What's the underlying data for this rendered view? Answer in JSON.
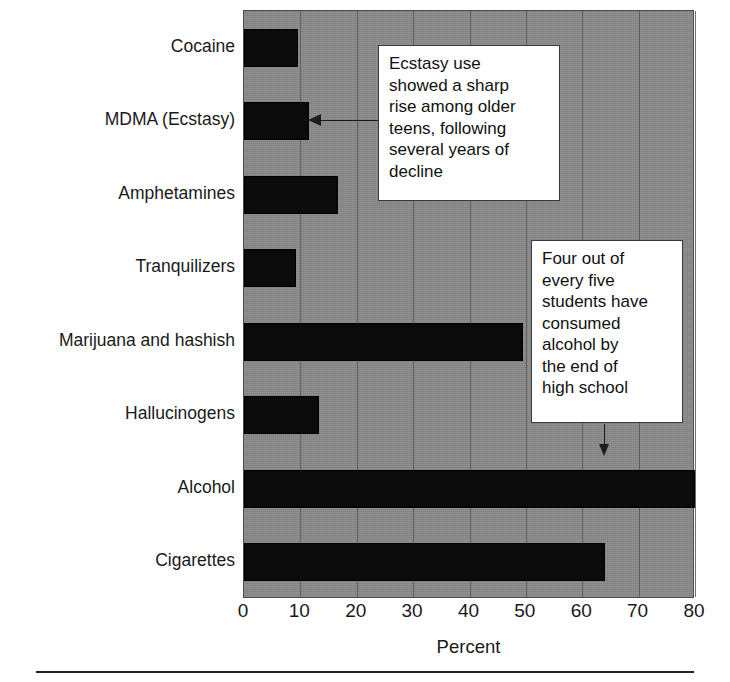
{
  "chart_data": {
    "type": "bar",
    "orientation": "horizontal",
    "title": "",
    "xlabel": "Percent",
    "ylabel": "",
    "xlim": [
      0,
      80
    ],
    "xticks": [
      0,
      10,
      20,
      30,
      40,
      50,
      60,
      70,
      80
    ],
    "xtick_labels": [
      "0",
      "10",
      "20",
      "30",
      "40",
      "50",
      "60",
      "70",
      "80"
    ],
    "grid": "vertical",
    "legend": "none",
    "plot_background_color": "#8a8a8a",
    "bar_color": "#0b0b0b",
    "categories": [
      "Cocaine",
      "MDMA (Ecstasy)",
      "Amphetamines",
      "Tranquilizers",
      "Marijuana and hashish",
      "Hallucinogens",
      "Alcohol",
      "Cigarettes"
    ],
    "values": [
      9.6,
      11.5,
      16.7,
      9.2,
      49.5,
      13.3,
      80,
      64
    ],
    "annotations": [
      {
        "id": "ecstasy-callout",
        "text": "Ecstasy use showed a sharp rise among older teens, following several years of decline",
        "target_category": "MDMA (Ecstasy)",
        "arrow": "left"
      },
      {
        "id": "alcohol-callout",
        "text": "Four out of every five students have consumed alcohol by the end of high school",
        "target_category": "Alcohol",
        "arrow": "down"
      }
    ]
  },
  "callouts": {
    "ecstasy": {
      "lines": [
        "Ecstasy use",
        "showed a sharp",
        "rise among older",
        "teens, following",
        "several years of",
        "decline"
      ],
      "text": "Ecstasy use\nshowed a sharp\nrise among older\nteens, following\nseveral years of\ndecline"
    },
    "alcohol": {
      "lines": [
        "Four out of",
        "every five",
        "students have",
        "consumed",
        "alcohol by",
        "the end of",
        "high school"
      ],
      "text": "Four out of\nevery five\nstudents have\nconsumed\nalcohol by\nthe end of\nhigh school"
    }
  }
}
